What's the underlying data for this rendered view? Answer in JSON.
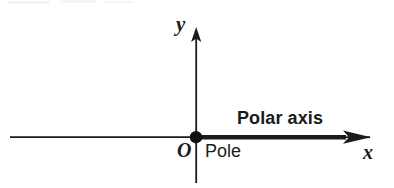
{
  "figure": {
    "background_color": "#ffffff",
    "ink_color": "#1b1b1b",
    "labels": {
      "y_axis": "y",
      "x_axis": "x",
      "origin": "O",
      "pole": "Pole",
      "polar_axis": "Polar axis"
    },
    "geometry": {
      "origin_x": 196,
      "origin_y": 137,
      "horizontal_axis_start_x": 10,
      "horizontal_axis_end_x": 371,
      "vertical_axis_top_y": 27,
      "vertical_axis_bottom_y": 183,
      "polar_ray_start_x": 196,
      "polar_ray_end_x": 345,
      "pole_dot_radius": 6,
      "thin_line_width": 1.6,
      "thick_line_width": 4.5
    },
    "elements": {
      "pole_dot": "pole-point",
      "x_arrowhead": "x-axis-arrowhead",
      "y_arrowhead": "y-axis-arrowhead"
    }
  }
}
